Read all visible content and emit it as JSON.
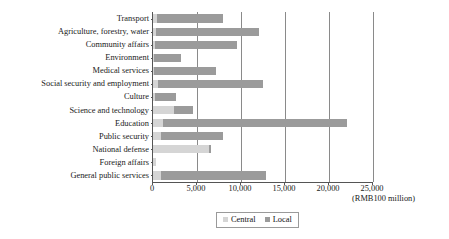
{
  "chart_data": {
    "type": "bar",
    "orientation": "horizontal",
    "stacked": true,
    "title": "",
    "subtitle": "",
    "xlabel": "(RMB100 million)",
    "ylabel": "",
    "xlim": [
      0,
      25000
    ],
    "xticks": [
      0,
      5000,
      10000,
      15000,
      20000,
      25000
    ],
    "xtick_labels": [
      "0",
      "5,000",
      "10,000",
      "15,000",
      "20,000",
      "25,000"
    ],
    "grid": true,
    "grid_axis": "x",
    "legend_position": "bottom",
    "categories": [
      "Transport",
      "Agriculture, forestry, water",
      "Community affairs",
      "Environment",
      "Medical services",
      "Social security and employment",
      "Culture",
      "Science and technology",
      "Education",
      "Public security",
      "National defense",
      "Foreign affairs",
      "General public services"
    ],
    "series": [
      {
        "name": "Central",
        "color": "#d5d5d5",
        "values": [
          500,
          300,
          200,
          150,
          150,
          600,
          200,
          2400,
          1100,
          900,
          6400,
          300,
          900
        ]
      },
      {
        "name": "Local",
        "color": "#9b9b9b",
        "values": [
          7500,
          11700,
          9300,
          3050,
          7050,
          11900,
          2400,
          2200,
          20900,
          7100,
          200,
          0,
          11900
        ]
      }
    ],
    "totals": [
      8000,
      12000,
      9500,
      3200,
      7200,
      12500,
      2600,
      4600,
      22000,
      8000,
      6600,
      300,
      12800
    ]
  },
  "legend": {
    "items": [
      {
        "label": "Central",
        "color": "#d5d5d5"
      },
      {
        "label": "Local",
        "color": "#9b9b9b"
      }
    ]
  },
  "axis": {
    "unit_note": "(RMB100 million)"
  }
}
